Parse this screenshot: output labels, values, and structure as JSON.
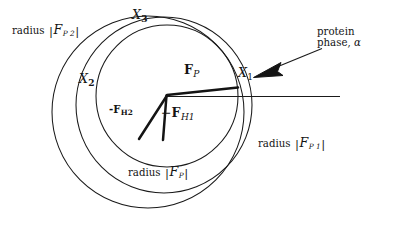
{
  "figure": {
    "kind": "harker-phase-diagram",
    "title_visible": false,
    "background_color": "#ffffff",
    "stroke_color": "#1a1a1a",
    "width": 403,
    "height": 252
  },
  "labels": {
    "radius_fp2": {
      "prefix": "radius",
      "bar_open": "|",
      "symbol": "F",
      "sub": "P 2",
      "bar_close": "|"
    },
    "radius_fp1": {
      "prefix": "radius",
      "bar_open": "|",
      "symbol": "F",
      "sub": "P 1",
      "bar_close": "|"
    },
    "radius_fp": {
      "prefix": "radius",
      "bar_open": "|",
      "symbol": "F",
      "sub": "P",
      "bar_close": "|"
    },
    "x1": {
      "symbol": "X",
      "sub": "1"
    },
    "x2": {
      "symbol": "X",
      "sub": "2"
    },
    "x3": {
      "symbol": "X",
      "sub": "3"
    },
    "fp_vector": {
      "symbol": "F",
      "sub": "P"
    },
    "fh1_vector": {
      "sign": "−",
      "symbol": "F",
      "sub": "H1"
    },
    "fh2_vector": {
      "sign": "-",
      "symbol": "F",
      "sub": "H2"
    },
    "protein_phase": {
      "line1": "protein",
      "line2_prefix": "phase,",
      "line2_symbol": "α"
    }
  },
  "geometry": {
    "circle_fp": {
      "cx": 167,
      "cy": 96,
      "r": 71,
      "name": "radius |F_P|"
    },
    "circle_fp1": {
      "cx": 164,
      "cy": 105,
      "r": 88,
      "name": "radius |F_P1|"
    },
    "circle_fp2": {
      "cx": 148,
      "cy": 112,
      "r": 96,
      "name": "radius |F_P2|"
    },
    "origin": {
      "x": 167,
      "y": 96
    },
    "intersection_x1": {
      "x": 238,
      "y": 88
    },
    "intersection_x2": {
      "x": 101,
      "y": 81
    },
    "intersection_x3": {
      "x": 150,
      "y": 31
    },
    "baseline": {
      "x1": 167,
      "y1": 96,
      "x2": 340,
      "y2": 96
    },
    "vector_fp": {
      "x1": 167,
      "y1": 96,
      "x2": 238,
      "y2": 88
    },
    "vector_fh1": {
      "x1": 167,
      "y1": 96,
      "x2": 163,
      "y2": 140
    },
    "vector_fh2": {
      "x1": 167,
      "y1": 96,
      "x2": 139,
      "y2": 139
    },
    "pointer_arrow": {
      "tail_x": 322,
      "tail_y": 49,
      "head_x": 255,
      "head_y": 76
    }
  }
}
